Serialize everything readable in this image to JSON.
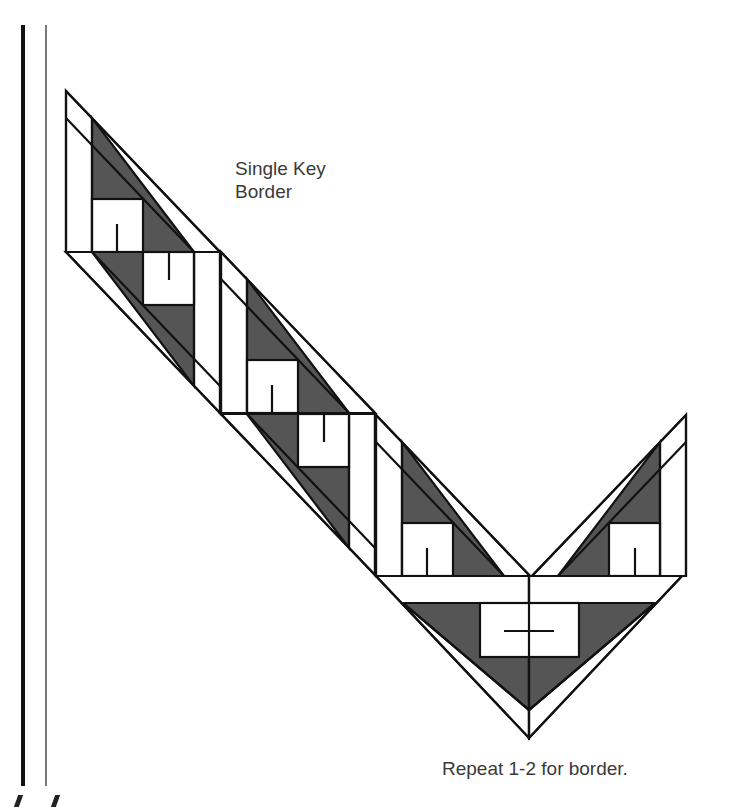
{
  "diagram": {
    "title_line1": "Single Key",
    "title_line2": "Border",
    "instruction": "Repeat 1-2 for border.",
    "colors": {
      "dark_fill": "#555555",
      "line": "#111111",
      "background": "#ffffff",
      "rule_thick": "#111111",
      "rule_thin": "#7a7a7a"
    },
    "units": [
      {
        "name": "unit-1-a",
        "type": "A",
        "origin": [
          66,
          91
        ]
      },
      {
        "name": "unit-1-b",
        "type": "B",
        "origin": [
          66,
          252
        ]
      },
      {
        "name": "unit-2-a",
        "type": "A",
        "origin": [
          220,
          252
        ]
      },
      {
        "name": "unit-2-b",
        "type": "B",
        "origin": [
          220,
          413
        ]
      },
      {
        "name": "unit-3-a",
        "type": "A",
        "origin": [
          376,
          415
        ]
      },
      {
        "name": "corner-unit",
        "type": "corner",
        "origin": [
          376,
          576
        ]
      },
      {
        "name": "unit-right-a",
        "type": "A-mirror",
        "origin": [
          529,
          415
        ]
      }
    ]
  }
}
